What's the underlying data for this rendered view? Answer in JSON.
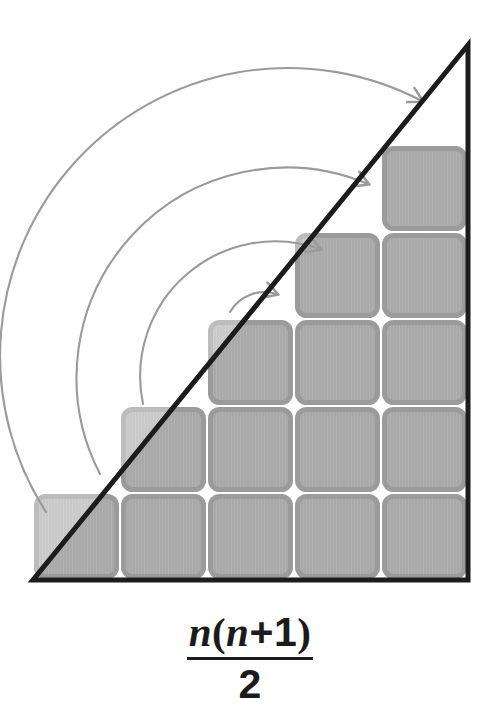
{
  "figure": {
    "canvas": {
      "width": 500,
      "height": 718
    },
    "colors": {
      "background": "#ffffff",
      "square_fill": "#a9a9a9",
      "square_fill_light": "#c9c9c9",
      "square_border": "#9b9b9b",
      "square_border_light": "#bcbcbc",
      "triangle_outline": "#1c1c1c",
      "arrow": "#9a9a9a",
      "formula_text": "#1b1b1b"
    },
    "triangle": {
      "label": "right-triangle-outline",
      "vertices": [
        {
          "x": 33,
          "y": 580
        },
        {
          "x": 468,
          "y": 580
        },
        {
          "x": 468,
          "y": 45
        }
      ],
      "stroke_width": 5
    },
    "grid": {
      "columns": 5,
      "column_heights": [
        1,
        2,
        3,
        4,
        5
      ],
      "cell_size": 87,
      "origin_x": 33,
      "baseline_y": 580,
      "gap": 7,
      "corner_radius": 9,
      "total_squares": 15
    },
    "arrows": [
      {
        "name": "arc-arrow-1",
        "from": {
          "x": 230,
          "y": 312
        },
        "to": {
          "x": 277,
          "y": 294
        },
        "radius": 40
      },
      {
        "name": "arc-arrow-2",
        "from": {
          "x": 143,
          "y": 404
        },
        "to": {
          "x": 320,
          "y": 249
        },
        "radius": 135
      },
      {
        "name": "arc-arrow-3",
        "from": {
          "x": 100,
          "y": 474
        },
        "to": {
          "x": 368,
          "y": 184
        },
        "radius": 210
      },
      {
        "name": "arc-arrow-4",
        "from": {
          "x": 46,
          "y": 512
        },
        "to": {
          "x": 422,
          "y": 101
        },
        "radius": 288
      }
    ],
    "formula": {
      "name": "triangular-number-formula",
      "expression": "n(n+1)/2",
      "numerator": {
        "var1": "n",
        "open_paren": "(",
        "var2": "n",
        "plus": "+",
        "one": "1",
        "close_paren": ")"
      },
      "denominator": "2"
    }
  }
}
